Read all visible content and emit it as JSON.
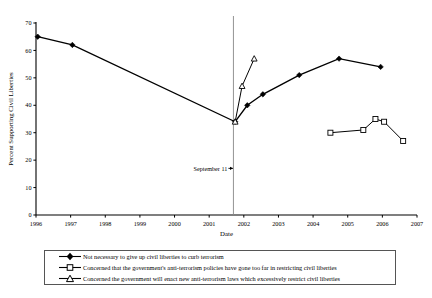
{
  "chart_data": {
    "type": "line",
    "title": "",
    "xlabel": "Date",
    "ylabel": "Percent Supporting Civil Liberties",
    "xlim": [
      1996,
      2007
    ],
    "ylim": [
      0,
      70
    ],
    "yticks": [
      0,
      10,
      20,
      30,
      40,
      50,
      60,
      70
    ],
    "xticks": [
      1996,
      1997,
      1998,
      1999,
      2000,
      2001,
      2002,
      2003,
      2004,
      2005,
      2006,
      2007
    ],
    "grid": false,
    "legend_position": "below",
    "annotations": [
      {
        "text": "September 11",
        "x": 2001.7,
        "y": 17,
        "marker": "vertical-line-with-arrow"
      }
    ],
    "reference_line": {
      "x": 2001.7,
      "orientation": "vertical"
    },
    "series": [
      {
        "name": "Not necessary to give up civil liberties to curb terrorism",
        "marker": "filled-diamond",
        "points": [
          {
            "x": 1996.05,
            "y": 65
          },
          {
            "x": 1997.05,
            "y": 62
          },
          {
            "x": 2001.75,
            "y": 34
          },
          {
            "x": 2002.1,
            "y": 40
          },
          {
            "x": 2002.55,
            "y": 44
          },
          {
            "x": 2003.6,
            "y": 51
          },
          {
            "x": 2004.75,
            "y": 57
          },
          {
            "x": 2005.95,
            "y": 54
          }
        ]
      },
      {
        "name": "Concerned that the government's anti-terrorism policies have gone too far in restricting civil liberties",
        "marker": "open-square",
        "points": [
          {
            "x": 2004.5,
            "y": 30
          },
          {
            "x": 2005.45,
            "y": 31
          },
          {
            "x": 2005.8,
            "y": 35
          },
          {
            "x": 2006.05,
            "y": 34
          },
          {
            "x": 2006.6,
            "y": 27
          }
        ]
      },
      {
        "name": "Concerned the government will enact new anti-terrorism laws which excessively restrict civil liberties",
        "marker": "open-triangle",
        "points": [
          {
            "x": 2001.75,
            "y": 34
          },
          {
            "x": 2001.95,
            "y": 47
          },
          {
            "x": 2002.3,
            "y": 57
          }
        ]
      }
    ]
  },
  "axis": {
    "y_label": "Percent Supporting Civil Liberties",
    "x_label": "Date",
    "y_ticks": [
      "0",
      "10",
      "20",
      "30",
      "40",
      "50",
      "60",
      "70"
    ],
    "x_ticks": [
      "1996",
      "1997",
      "1998",
      "1999",
      "2000",
      "2001",
      "2002",
      "2003",
      "2004",
      "2005",
      "2006",
      "2007"
    ]
  },
  "annotation": {
    "september11": "September 11"
  },
  "legend": {
    "items": [
      {
        "label": "Not necessary to give up civil liberties to curb terrorism",
        "marker": "filled-diamond"
      },
      {
        "label": "Concerned that the government's anti-terrorism policies have gone too far in restricting civil liberties",
        "marker": "open-square"
      },
      {
        "label": "Concerned the government will enact new anti-terrorism laws which excessively restrict civil liberties",
        "marker": "open-triangle"
      }
    ]
  }
}
